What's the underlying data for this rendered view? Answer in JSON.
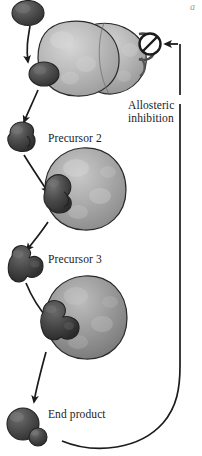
{
  "figure": {
    "corner_mark": "a"
  },
  "labels": {
    "precursor_2": "Precursor 2",
    "precursor_3": "Precursor 3",
    "end_product": "End product",
    "allosteric_line1": "Allosteric",
    "allosteric_line2": "inhibition"
  },
  "colors": {
    "ink": "#1b1b1b",
    "enzyme_light": "#b9b9b9",
    "enzyme_mid": "#a8a8a8",
    "enzyme_dark": "#8f8f8f",
    "substrate_dark": "#4a4a4a",
    "substrate_darker": "#3a3a3a",
    "outline": "#2a2a2a",
    "background": "#ffffff"
  },
  "elements": {
    "substrate_top": "substrate-molecule",
    "enzyme_1": "enzyme-one",
    "enzyme_2": "enzyme-two",
    "enzyme_3": "enzyme-three",
    "precursor_2_molecule": "precursor-2-molecule",
    "precursor_3_molecule": "precursor-3-molecule",
    "end_product_molecule": "end-product-molecule",
    "inhibition_symbol": "no-entry-symbol",
    "feedback_loop": "feedback-inhibition-loop"
  }
}
